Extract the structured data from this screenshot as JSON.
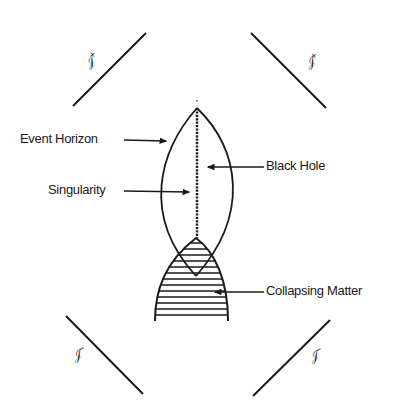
{
  "diagram": {
    "labels": {
      "event_horizon": "Event Horizon",
      "singularity": "Singularity",
      "black_hole": "Black Hole",
      "collapsing_matter": "Collapsing Matter"
    },
    "null_infinity": {
      "top_left": {
        "symbol": "𝒥",
        "sign": "+"
      },
      "top_right": {
        "symbol": "𝒥",
        "sign": "+"
      },
      "bottom_left": {
        "symbol": "𝒥",
        "sign": "−"
      },
      "bottom_right": {
        "symbol": "𝒥",
        "sign": "−"
      }
    },
    "colors": {
      "ink": "#1a1a1a",
      "background": "#ffffff"
    }
  }
}
